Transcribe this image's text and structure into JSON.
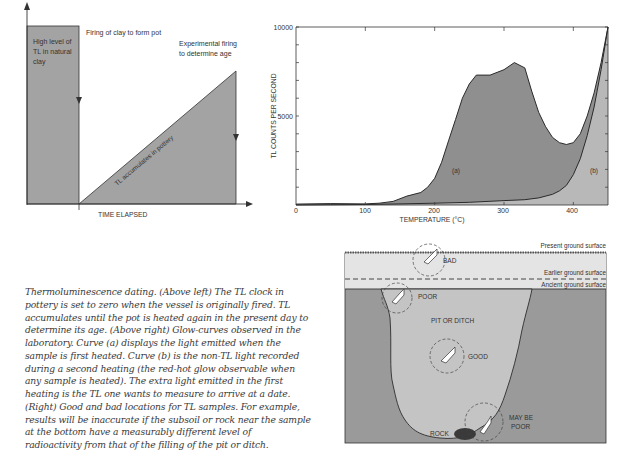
{
  "figure_left": {
    "type": "schematic-area",
    "labels": {
      "natural_clay": [
        "High level of",
        "TL in natural",
        "clay"
      ],
      "firing": "Firing of clay to form pot",
      "experimental": [
        "Experimental firing",
        "to determine age"
      ],
      "accumulates": "TL accumulates in pottery",
      "xlabel": "TIME ELAPSED"
    }
  },
  "chart_data": {
    "type": "area",
    "title": "",
    "xlabel": "TEMPERATURE (°C)",
    "ylabel": "TL COUNTS PER SECOND",
    "xlim": [
      0,
      450
    ],
    "ylim": [
      0,
      10000
    ],
    "x_ticks": [
      "0",
      "100",
      "200",
      "300",
      "400"
    ],
    "y_ticks": [
      "5000",
      "10000"
    ],
    "grid": false,
    "legend": null,
    "annotations": [
      "(a)",
      "(b)"
    ],
    "series": [
      {
        "name": "(a) first heating (TL + non-TL)",
        "x": [
          0,
          50,
          100,
          120,
          140,
          160,
          180,
          190,
          200,
          210,
          220,
          230,
          240,
          250,
          260,
          280,
          300,
          315,
          330,
          340,
          350,
          360,
          370,
          380,
          390,
          400,
          410,
          420,
          430,
          440,
          450
        ],
        "y": [
          50,
          80,
          60,
          100,
          200,
          500,
          700,
          1000,
          1500,
          2400,
          3600,
          4800,
          6000,
          6800,
          7300,
          7300,
          7600,
          8000,
          7700,
          6400,
          5200,
          4400,
          3800,
          3500,
          3400,
          3500,
          4000,
          5000,
          6300,
          8000,
          10000
        ]
      },
      {
        "name": "(b) second heating (non-TL red-hot glow)",
        "x": [
          0,
          100,
          150,
          200,
          250,
          300,
          330,
          350,
          370,
          380,
          390,
          400,
          410,
          420,
          430,
          440,
          450
        ],
        "y": [
          0,
          30,
          60,
          100,
          150,
          250,
          300,
          400,
          600,
          800,
          1100,
          1700,
          2600,
          3900,
          5500,
          7600,
          10000
        ]
      }
    ]
  },
  "figure_right": {
    "type": "section-diagram",
    "layers": [
      "Present ground surface",
      "Earlier ground surface",
      "Ancient ground surface"
    ],
    "labels": {
      "pit": "PIT OR DITCH",
      "bad": "BAD",
      "poor": "POOR",
      "good": "GOOD",
      "may_be_poor": [
        "MAY BE",
        "POOR"
      ],
      "rock": "ROCK"
    }
  },
  "caption": {
    "lines": [
      "Thermoluminescence dating. (Above left) The TL clock in",
      "pottery is set to zero when the vessel is originally fired. TL",
      "accumulates until the pot is heated again in the present day to",
      "determine its age. (Above right) Glow-curves observed in the",
      "laboratory. Curve (a) displays the light emitted when the",
      "sample is first heated. Curve (b) is the non-TL light recorded",
      "during a second heating (the red-hot glow observable when",
      "any sample is heated). The extra light emitted in the first",
      "heating is the TL one wants to measure to arrive at a date.",
      "(Right) Good and bad locations for TL samples. For example,",
      "results will be inaccurate if the subsoil or rock near the sample",
      "at the bottom have a measurably different level of",
      "radioactivity from that of the filling of the pit or ditch."
    ]
  },
  "colors": {
    "area_dark": "#8f8f8f",
    "area_light": "#b8b8b8",
    "soil": "#9a9a9a",
    "pit_fill": "#c4c4c4",
    "topsoil": "#e6e6e6",
    "ink": "#2e2e2e"
  }
}
